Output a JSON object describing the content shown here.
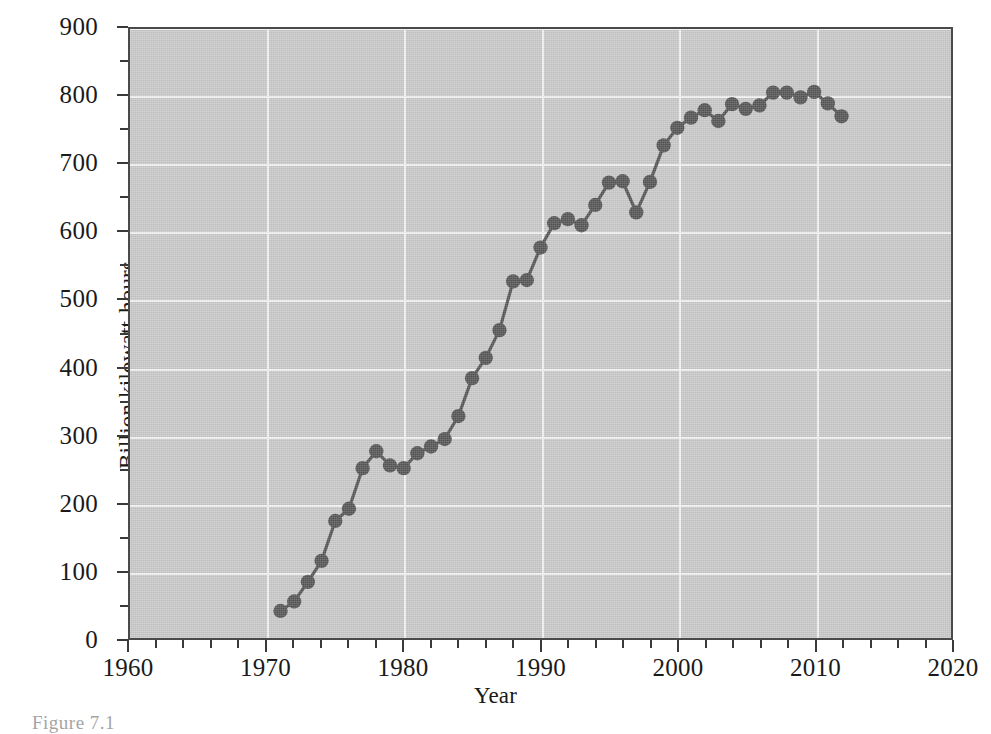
{
  "caption": "Figure 7.1",
  "chart_data": {
    "type": "line",
    "title": "",
    "subtitle": "",
    "xlabel": "Year",
    "ylabel": "Billion kilowatt-hours",
    "xlim": [
      1960,
      2020
    ],
    "ylim": [
      0,
      900
    ],
    "x_major_ticks": [
      1960,
      1970,
      1980,
      1990,
      2000,
      2010,
      2020
    ],
    "x_tick_labels": [
      "1960",
      "1970",
      "1980",
      "1990",
      "2000",
      "2010",
      "2020"
    ],
    "x_minor_tick_step": 2,
    "y_major_ticks": [
      0,
      100,
      200,
      300,
      400,
      500,
      600,
      700,
      800,
      900
    ],
    "y_tick_labels": [
      "0",
      "100",
      "200",
      "300",
      "400",
      "500",
      "600",
      "700",
      "800",
      "900"
    ],
    "y_minor_tick_step": 50,
    "grid": true,
    "grid_color": "#f2f2f2",
    "plot_background": "#c9c9c9",
    "legend": null,
    "legend_position": "none",
    "marker": "circle",
    "marker_color": "#555555",
    "line_color": "#555555",
    "x": [
      1971,
      1972,
      1973,
      1974,
      1975,
      1976,
      1977,
      1978,
      1979,
      1980,
      1981,
      1982,
      1983,
      1984,
      1985,
      1986,
      1987,
      1988,
      1989,
      1990,
      1991,
      1992,
      1993,
      1994,
      1995,
      1996,
      1997,
      1998,
      1999,
      2000,
      2001,
      2002,
      2003,
      2004,
      2005,
      2006,
      2007,
      2008,
      2009,
      2010,
      2011,
      2012
    ],
    "values": [
      40,
      54,
      83,
      114,
      173,
      191,
      251,
      276,
      255,
      251,
      273,
      283,
      294,
      328,
      384,
      414,
      455,
      527,
      529,
      577,
      613,
      619,
      610,
      640,
      673,
      675,
      629,
      674,
      728,
      754,
      769,
      780,
      764,
      789,
      782,
      787,
      806,
      806,
      799,
      807,
      790,
      771
    ],
    "n_points": 42,
    "y_first": 40,
    "y_last": 771,
    "y_max": 807,
    "y_max_year": 2010
  }
}
